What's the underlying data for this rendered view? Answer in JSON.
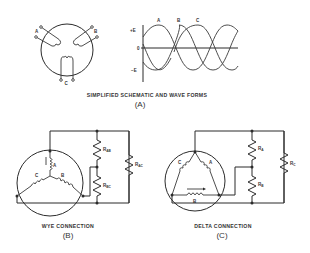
{
  "panel_a": {
    "caption": "SIMPLIFIED SCHEMATIC AND WAVE FORMS",
    "label": "(A)",
    "schematic": {
      "coil_labels": [
        "A",
        "B",
        "C"
      ]
    },
    "waveform": {
      "y_axis_labels": {
        "positive": "+E",
        "zero": "0",
        "negative": "−E"
      },
      "wave_labels": [
        "A",
        "B",
        "C"
      ]
    }
  },
  "panel_b": {
    "caption": "WYE CONNECTION",
    "label": "(B)",
    "coil_labels": [
      "A",
      "B",
      "C"
    ],
    "resistors": [
      {
        "name": "R",
        "sub": "AB"
      },
      {
        "name": "R",
        "sub": "BC"
      },
      {
        "name": "R",
        "sub": "AC"
      }
    ]
  },
  "panel_c": {
    "caption": "DELTA CONNECTION",
    "label": "(C)",
    "coil_labels": [
      "A",
      "B",
      "C"
    ],
    "resistors": [
      {
        "name": "R",
        "sub": "A"
      },
      {
        "name": "R",
        "sub": "B"
      },
      {
        "name": "R",
        "sub": "C"
      }
    ]
  },
  "colors": {
    "ink": "#2b2b2b",
    "background": "#ffffff"
  }
}
